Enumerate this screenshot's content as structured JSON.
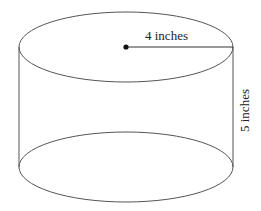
{
  "diagram": {
    "shape": "cylinder",
    "radius_label": "4 inches",
    "height_label": "5 inches",
    "stroke_color": "#555555",
    "dot_color": "#111111",
    "geometry": {
      "top_ellipse": {
        "cx": 126,
        "cy": 47,
        "rx": 107,
        "ry": 35
      },
      "bottom_ellipse": {
        "cx": 126,
        "cy": 167,
        "rx": 107,
        "ry": 35
      }
    }
  }
}
